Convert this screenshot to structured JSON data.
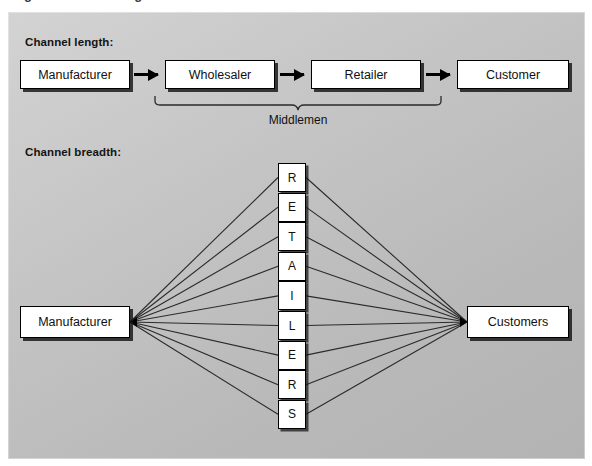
{
  "caption_clipped": "Figure 8.1  Marketing channel structures",
  "panel": {
    "background_from": "#d3d3d3",
    "background_to": "#b3b3b3"
  },
  "sections": {
    "length": {
      "title": "Channel length:",
      "nodes": [
        {
          "label": "Manufacturer"
        },
        {
          "label": "Wholesaler"
        },
        {
          "label": "Retailer"
        },
        {
          "label": "Customer"
        }
      ],
      "bracket_label": "Middlemen",
      "bracket_spans": [
        "Wholesaler",
        "Retailer"
      ],
      "arrow_count": 3
    },
    "breadth": {
      "title": "Channel breadth:",
      "source": {
        "label": "Manufacturer"
      },
      "target": {
        "label": "Customers"
      },
      "middle_column_word": "RETAILERS",
      "middle_column_letters": [
        "R",
        "E",
        "T",
        "A",
        "I",
        "L",
        "E",
        "R",
        "S"
      ],
      "link_count_left": 9,
      "link_count_right": 9
    }
  },
  "colors": {
    "box_fill": "#ffffff",
    "box_border": "#000000",
    "shadow": "#141414",
    "text": "#111111",
    "line": "#2a2a2a"
  }
}
